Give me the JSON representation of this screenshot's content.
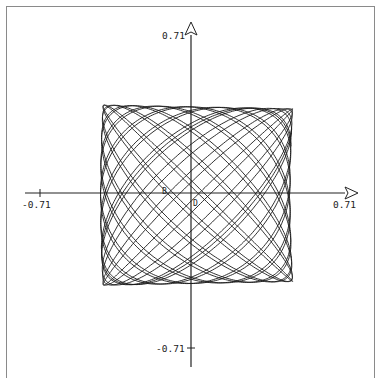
{
  "chart_data": {
    "type": "line",
    "subtype": "phase-portrait",
    "title": "",
    "xlabel": "",
    "ylabel": "",
    "xlim": [
      -0.71,
      0.71
    ],
    "ylim": [
      -0.71,
      0.71
    ],
    "grid": false,
    "legend": null,
    "x_ticks": [
      {
        "value": -0.71,
        "label": "-0.71"
      },
      {
        "value": 0.71,
        "label": "0.71"
      }
    ],
    "y_ticks": [
      {
        "value": 0.71,
        "label": "0.71"
      },
      {
        "value": -0.71,
        "label": "-0.71"
      }
    ],
    "annotations": [
      {
        "text": "B",
        "x": -0.12,
        "y": 0.0
      },
      {
        "text": "D",
        "x": 0.0,
        "y": -0.06
      }
    ],
    "curve": {
      "description": "Quasi-periodic Lissajous-like trajectory filling a rounded region",
      "x_extent": [
        -0.42,
        0.46
      ],
      "y_extent": [
        -0.42,
        0.4
      ],
      "params": {
        "ax": 0.44,
        "ay": 0.41,
        "x_offset": 0.02,
        "y_offset": -0.01,
        "freq_ratio": 1.055,
        "phase": 0.6,
        "asym": 0.06,
        "turns": 19,
        "samples": 5000
      }
    }
  },
  "labels": {
    "x_neg": "-0.71",
    "x_pos": "0.71",
    "y_pos": "0.71",
    "y_neg": "-0.71",
    "mark_b": "B",
    "mark_d": "D"
  }
}
